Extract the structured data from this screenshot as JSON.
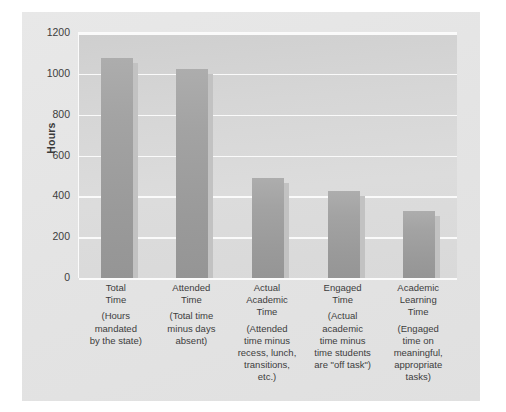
{
  "chart_data": {
    "type": "bar",
    "title": "",
    "xlabel": "",
    "ylabel": "Hours",
    "ylim": [
      0,
      1200
    ],
    "yticks": [
      0,
      200,
      400,
      600,
      800,
      1000,
      1200
    ],
    "grid": true,
    "legend": null,
    "categories": [
      "Total Time",
      "Attended Time",
      "Actual Academic Time",
      "Engaged Time",
      "Academic Learning Time"
    ],
    "values": [
      1080,
      1025,
      490,
      425,
      330
    ],
    "bar_color": "#9e9e9e",
    "plot_background": "#d6d6d6",
    "panel_background": "#e5e5e5",
    "gridline_color": "#fafafa",
    "categories_detail": [
      {
        "title_lines": [
          "Total",
          "Time"
        ],
        "description_lines": [
          "(Hours",
          "mandated",
          "by the state)"
        ],
        "value": 1080
      },
      {
        "title_lines": [
          "Attended",
          "Time"
        ],
        "description_lines": [
          "(Total time",
          "minus days",
          "absent)"
        ],
        "value": 1025
      },
      {
        "title_lines": [
          "Actual",
          "Academic",
          "Time"
        ],
        "description_lines": [
          "(Attended",
          "time minus",
          "recess, lunch,",
          "transitions,",
          "etc.)"
        ],
        "value": 490
      },
      {
        "title_lines": [
          "Engaged",
          "Time"
        ],
        "description_lines": [
          "(Actual",
          "academic",
          "time minus",
          "time students",
          "are \"off task\")"
        ],
        "value": 425
      },
      {
        "title_lines": [
          "Academic",
          "Learning",
          "Time"
        ],
        "description_lines": [
          "(Engaged",
          "time on",
          "meaningful,",
          "appropriate",
          "tasks)"
        ],
        "value": 330
      }
    ]
  },
  "axis": {
    "y_title": "Hours",
    "tick_labels": [
      "1200",
      "1000",
      "800",
      "600",
      "400",
      "200",
      "0"
    ]
  }
}
